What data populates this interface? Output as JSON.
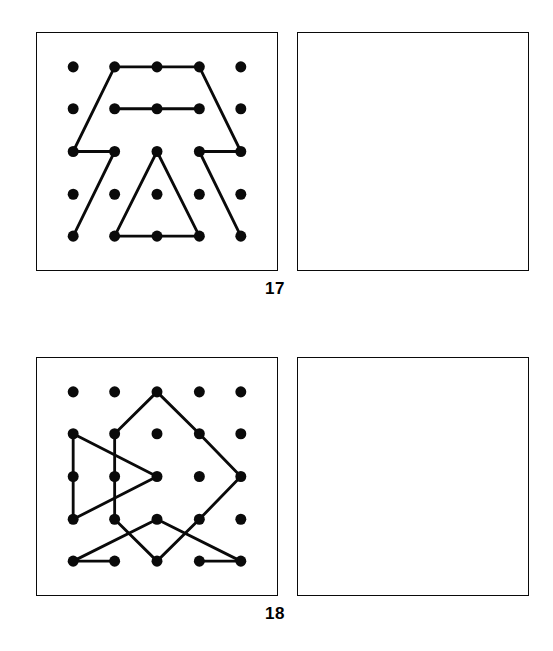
{
  "page": {
    "background": "#ffffff",
    "ink": "#0a0a0a",
    "kind": "dot-grid-pattern-copy-worksheet"
  },
  "exercises": [
    {
      "number": "17",
      "pattern_panel_name": "pattern-grid-17",
      "answer_panel_name": "answer-box-17",
      "grid": {
        "rows": 5,
        "cols": 5,
        "dot_radius": 6.2,
        "dot_color": "#0a0a0a",
        "x": [
          41,
          88,
          136,
          184,
          231
        ],
        "y": [
          38,
          85,
          133,
          181,
          228
        ]
      },
      "line_color": "#0a0a0a",
      "line_width": 3.2,
      "segments": [
        {
          "from": [
            1,
            0
          ],
          "to": [
            2,
            0
          ]
        },
        {
          "from": [
            2,
            0
          ],
          "to": [
            3,
            0
          ]
        },
        {
          "from": [
            1,
            0
          ],
          "to": [
            0,
            2
          ]
        },
        {
          "from": [
            0,
            2
          ],
          "to": [
            1,
            2
          ]
        },
        {
          "from": [
            1,
            2
          ],
          "to": [
            0,
            4
          ]
        },
        {
          "from": [
            3,
            0
          ],
          "to": [
            4,
            2
          ]
        },
        {
          "from": [
            4,
            2
          ],
          "to": [
            3,
            2
          ]
        },
        {
          "from": [
            3,
            2
          ],
          "to": [
            4,
            4
          ]
        },
        {
          "from": [
            1,
            1
          ],
          "to": [
            2,
            1
          ]
        },
        {
          "from": [
            2,
            1
          ],
          "to": [
            3,
            1
          ]
        },
        {
          "from": [
            2,
            2
          ],
          "to": [
            1,
            4
          ]
        },
        {
          "from": [
            2,
            2
          ],
          "to": [
            3,
            4
          ]
        },
        {
          "from": [
            1,
            4
          ],
          "to": [
            2,
            4
          ]
        },
        {
          "from": [
            2,
            4
          ],
          "to": [
            3,
            4
          ]
        }
      ]
    },
    {
      "number": "18",
      "pattern_panel_name": "pattern-grid-18",
      "answer_panel_name": "answer-box-18",
      "grid": {
        "rows": 5,
        "cols": 5,
        "dot_radius": 6.2,
        "dot_color": "#0a0a0a",
        "x": [
          41,
          88,
          136,
          184,
          231
        ],
        "y": [
          38,
          85,
          133,
          181,
          228
        ]
      },
      "line_color": "#0a0a0a",
      "line_width": 3.2,
      "segments": [
        {
          "from": [
            2,
            0
          ],
          "to": [
            1,
            1
          ]
        },
        {
          "from": [
            2,
            0
          ],
          "to": [
            3,
            1
          ]
        },
        {
          "from": [
            3,
            1
          ],
          "to": [
            4,
            2
          ]
        },
        {
          "from": [
            4,
            2
          ],
          "to": [
            3,
            3
          ]
        },
        {
          "from": [
            0,
            1
          ],
          "to": [
            0,
            2
          ]
        },
        {
          "from": [
            0,
            2
          ],
          "to": [
            0,
            3
          ]
        },
        {
          "from": [
            1,
            1
          ],
          "to": [
            1,
            2
          ]
        },
        {
          "from": [
            1,
            2
          ],
          "to": [
            1,
            3
          ]
        },
        {
          "from": [
            0,
            1
          ],
          "to": [
            2,
            2
          ]
        },
        {
          "from": [
            2,
            2
          ],
          "to": [
            0,
            3
          ]
        },
        {
          "from": [
            1,
            3
          ],
          "to": [
            2,
            4
          ]
        },
        {
          "from": [
            2,
            4
          ],
          "to": [
            3,
            3
          ]
        },
        {
          "from": [
            0,
            4
          ],
          "to": [
            2,
            3
          ]
        },
        {
          "from": [
            2,
            3
          ],
          "to": [
            4,
            4
          ]
        },
        {
          "from": [
            0,
            4
          ],
          "to": [
            1,
            4
          ]
        },
        {
          "from": [
            3,
            4
          ],
          "to": [
            4,
            4
          ]
        }
      ]
    }
  ]
}
